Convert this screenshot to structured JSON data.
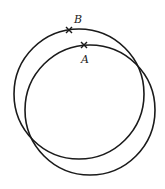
{
  "diagram": {
    "stroke_color": "#1a1a1a",
    "circles": [
      {
        "name": "circle-upper-left",
        "cx": 79,
        "cy": 94,
        "r": 65
      },
      {
        "name": "circle-lower-right",
        "cx": 90,
        "cy": 110,
        "r": 65
      }
    ],
    "points": [
      {
        "id": "B",
        "label": "B",
        "x": 69,
        "y": 30,
        "label_x": 74,
        "label_y": 23,
        "marker": "x-mark"
      },
      {
        "id": "A",
        "label": "A",
        "x": 84,
        "y": 45,
        "label_x": 81,
        "label_y": 63,
        "marker": "x-mark"
      }
    ]
  }
}
